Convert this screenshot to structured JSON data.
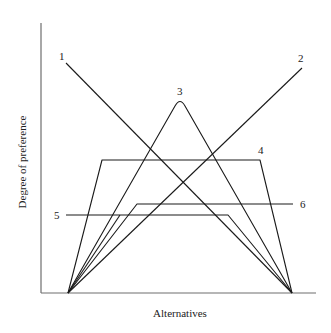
{
  "diagram": {
    "type": "preference-curves",
    "axes": {
      "x_label": "Alternatives",
      "y_label": "Degree of preference"
    },
    "curves": [
      {
        "id": "1",
        "label": "1",
        "shape": "descending line",
        "points": [
          [
            66,
            63
          ],
          [
            292,
            293
          ]
        ],
        "label_pos": [
          62,
          60
        ]
      },
      {
        "id": "2",
        "label": "2",
        "shape": "ascending line",
        "points": [
          [
            68,
            293
          ],
          [
            302,
            68
          ]
        ],
        "label_pos": [
          300,
          61
        ]
      },
      {
        "id": "3",
        "label": "3",
        "shape": "peaked (triangular)",
        "points": [
          [
            68,
            293
          ],
          [
            180,
            100
          ],
          [
            292,
            293
          ]
        ],
        "label_pos": [
          180,
          93
        ]
      },
      {
        "id": "4",
        "label": "4",
        "shape": "trapezoid high plateau",
        "points": [
          [
            68,
            293
          ],
          [
            102,
            160
          ],
          [
            260,
            160
          ],
          [
            292,
            293
          ]
        ],
        "label_pos": [
          261,
          152
        ]
      },
      {
        "id": "5",
        "label": "5",
        "shape": "flat then descending",
        "points": [
          [
            66,
            215
          ],
          [
            228,
            215
          ],
          [
            292,
            293
          ]
        ],
        "label_pos": [
          57,
          219
        ]
      },
      {
        "id": "6",
        "label": "6",
        "shape": "ascending then flat",
        "points": [
          [
            68,
            293
          ],
          [
            137,
            204
          ],
          [
            293,
            204
          ]
        ],
        "label_pos": [
          299,
          208
        ]
      }
    ],
    "colors": {
      "axis": "#6e6e6e",
      "curve": "#1a1a1a",
      "background": "#ffffff"
    }
  }
}
